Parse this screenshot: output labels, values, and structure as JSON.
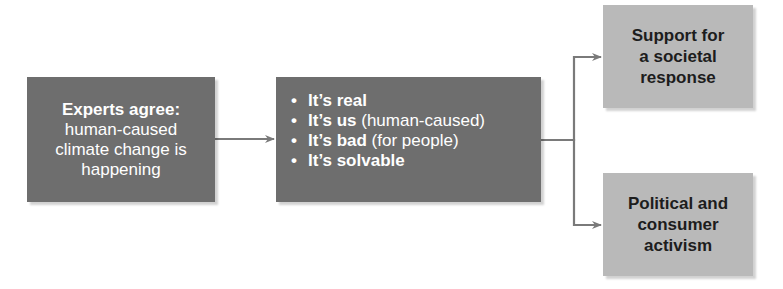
{
  "diagram": {
    "colors": {
      "dark_box": "#6e6e6e",
      "light_box": "#b9b9b9",
      "connector": "#7a7a7a",
      "dark_text": "#ffffff",
      "light_text": "#1d1d1d"
    },
    "experts_box": {
      "heading": "Experts agree:",
      "lines": [
        "human-caused",
        "climate change is",
        "happening"
      ]
    },
    "facts_box": {
      "bullet": "•",
      "items": [
        {
          "bold": "It’s real",
          "rest": ""
        },
        {
          "bold": "It’s us",
          "rest": " (human-caused)"
        },
        {
          "bold": "It’s bad",
          "rest": " (for people)"
        },
        {
          "bold": "It’s solvable",
          "rest": ""
        }
      ]
    },
    "support_box": {
      "lines": [
        "Support for",
        "a societal",
        "response"
      ]
    },
    "activism_box": {
      "lines": [
        "Political and",
        "consumer",
        "activism"
      ]
    },
    "connectors": [
      {
        "from": "experts_box",
        "to": "facts_box"
      },
      {
        "from": "facts_box",
        "to": "support_box"
      },
      {
        "from": "facts_box",
        "to": "activism_box"
      }
    ]
  }
}
